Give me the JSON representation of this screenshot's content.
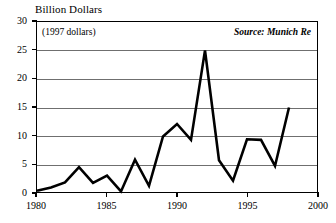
{
  "chart_data": {
    "type": "line",
    "title": "Billion Dollars",
    "subtitle": "(1997 dollars)",
    "source_note": "Source: Munich Re",
    "xlabel": "",
    "ylabel": "Billion Dollars",
    "xlim": [
      1980,
      2000
    ],
    "ylim": [
      0,
      30
    ],
    "grid": true,
    "legend": "none",
    "line_color": "#000000",
    "grid_color": "#6f6f6f",
    "axis_color": "#000000",
    "y_ticks": [
      0,
      5,
      10,
      15,
      20,
      25,
      30
    ],
    "y_tick_labels": [
      "0",
      "5",
      "10",
      "15",
      "20",
      "25",
      "30"
    ],
    "x_ticks": [
      1980,
      1985,
      1990,
      1995,
      2000
    ],
    "x_tick_labels": [
      "1980",
      "1985",
      "1990",
      "1995",
      "2000"
    ],
    "x": [
      1980,
      1981,
      1982,
      1983,
      1984,
      1985,
      1986,
      1987,
      1988,
      1989,
      1990,
      1991,
      1992,
      1993,
      1994,
      1995,
      1996,
      1997,
      1998
    ],
    "values": [
      0.2,
      0.8,
      1.7,
      4.4,
      1.6,
      2.9,
      0.1,
      5.7,
      1.1,
      9.8,
      12.0,
      9.2,
      25.0,
      5.6,
      2.0,
      9.3,
      9.2,
      4.6,
      14.9
    ],
    "series": [
      {
        "name": "Weather-related insured losses",
        "values": [
          0.2,
          0.8,
          1.7,
          4.4,
          1.6,
          2.9,
          0.1,
          5.7,
          1.1,
          9.8,
          12.0,
          9.2,
          25.0,
          5.6,
          2.0,
          9.3,
          9.2,
          4.6,
          14.9
        ]
      }
    ]
  }
}
